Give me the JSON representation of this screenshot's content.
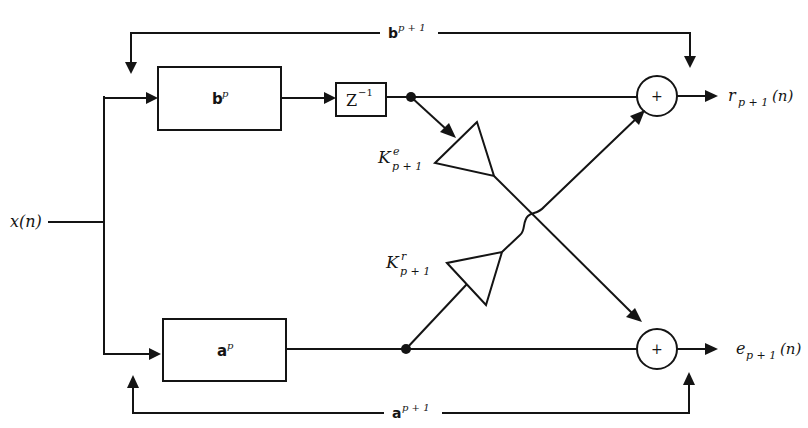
{
  "diagram": {
    "input": {
      "label": "x(n)"
    },
    "blocks": {
      "b_filter": {
        "base": "b",
        "sup": "p"
      },
      "a_filter": {
        "base": "a",
        "sup": "p"
      },
      "delay": {
        "base": "Z",
        "sup": "−1"
      }
    },
    "gains": {
      "ke": {
        "base": "K",
        "sup": "e",
        "sub": "p + 1"
      },
      "kr": {
        "base": "K",
        "sup": "r",
        "sub": "p + 1"
      }
    },
    "adders": {
      "top": {
        "symbol": "+"
      },
      "bottom": {
        "symbol": "+"
      }
    },
    "feedback": {
      "b_next": {
        "base": "b",
        "sup": "p + 1"
      },
      "a_next": {
        "base": "a",
        "sup": "p + 1"
      }
    },
    "outputs": {
      "r": {
        "base": "r",
        "sub": "p + 1",
        "tail": "(n)"
      },
      "e": {
        "base": "e",
        "sub": "p + 1",
        "tail": "(n)"
      }
    }
  }
}
